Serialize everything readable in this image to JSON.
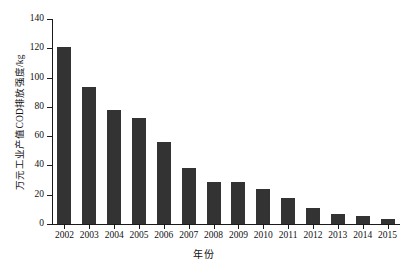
{
  "chart_data": {
    "type": "bar",
    "title": "",
    "subtitle": "",
    "xlabel": "年份",
    "ylabel": "万元工业产值COD排放强度/kg",
    "categories": [
      "2002",
      "2003",
      "2004",
      "2005",
      "2006",
      "2007",
      "2008",
      "2009",
      "2010",
      "2011",
      "2012",
      "2013",
      "2014",
      "2015"
    ],
    "values": [
      121,
      93.5,
      78,
      72.5,
      56,
      38.5,
      29,
      29,
      24,
      17.5,
      11,
      7,
      5.5,
      3.5
    ],
    "series": [
      {
        "name": "万元工业产值COD排放强度",
        "values": [
          121,
          93.5,
          78,
          72.5,
          56,
          38.5,
          29,
          29,
          24,
          17.5,
          11,
          7,
          5.5,
          3.5
        ]
      }
    ],
    "ylim": [
      0,
      140
    ],
    "yticks": [
      0,
      20,
      40,
      60,
      80,
      100,
      120,
      140
    ],
    "ytick_labels": [
      "0",
      "20",
      "40",
      "60",
      "80",
      "100",
      "120",
      "140"
    ],
    "grid": false,
    "legend": false,
    "legend_position": "none",
    "bar_color": "#333333",
    "axis_color": "#1a1a1a",
    "background_color": "#ffffff",
    "annotations": []
  }
}
